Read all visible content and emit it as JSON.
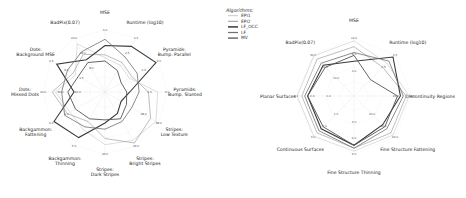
{
  "legend": {
    "title": "Algorithms:",
    "items": [
      {
        "name": "EPI1",
        "color": "#c8c8c8",
        "width": 0.6
      },
      {
        "name": "EPI2",
        "color": "#a0a0a0",
        "width": 0.7
      },
      {
        "name": "LF_OCC",
        "color": "#3a3a3a",
        "width": 1.1
      },
      {
        "name": "LF",
        "color": "#707070",
        "width": 0.8
      },
      {
        "name": "MV",
        "color": "#555555",
        "width": 0.9
      }
    ]
  },
  "chart_data": [
    {
      "type": "radar",
      "title": "",
      "axes": [
        "MSE",
        "Runtime (log10)",
        "Pyramids: Bump. Parallel",
        "Pyramids: Bump. Slanted",
        "Stripes: Low Texture",
        "Stripes: Bright Stripes",
        "Stripes: Dark Stripes",
        "Backgammon: Thinning",
        "Backgammon: Fattening",
        "Dots: Missed Dots",
        "Dots: Background MSE",
        "BadPix(0.07)"
      ],
      "tick_labels": {
        "MSE": [
          "3.0"
        ],
        "Runtime (log10)": [
          "4.5",
          "2.5"
        ],
        "Pyramids: Bump. Parallel": [
          "3.0",
          "1.0"
        ],
        "Pyramids: Bump. Slanted": [
          "3.0",
          "2.0"
        ],
        "Stripes: Low Texture": [
          "38.0",
          "28.0"
        ],
        "Stripes: Bright Stripes": [
          "46.0"
        ],
        "Stripes: Dark Stripes": [
          "46.0"
        ],
        "Backgammon: Thinning": [
          "5.0"
        ],
        "Backgammon: Fattening": [
          "6.0",
          "4.0"
        ],
        "Dots: Missed Dots": [
          "40.0",
          "30.0",
          "20.0"
        ],
        "Dots: Background MSE": [
          "4.5",
          "3.0",
          "1.5"
        ],
        "BadPix(0.07)": [
          "24.0",
          "18.0",
          "8.0"
        ]
      },
      "series": [
        {
          "name": "EPI1",
          "values": [
            0.55,
            0.5,
            0.45,
            0.85,
            0.95,
            0.9,
            0.85,
            0.7,
            0.65,
            0.8,
            0.55,
            0.9
          ]
        },
        {
          "name": "EPI2",
          "values": [
            0.6,
            0.55,
            0.5,
            0.7,
            0.85,
            0.95,
            0.75,
            0.55,
            0.7,
            0.85,
            0.6,
            0.7
          ]
        },
        {
          "name": "LF_OCC",
          "values": [
            0.75,
            0.85,
            0.95,
            0.4,
            0.3,
            0.4,
            0.5,
            0.85,
            0.95,
            0.5,
            0.9,
            0.6
          ]
        },
        {
          "name": "LF",
          "values": [
            0.85,
            0.65,
            0.6,
            0.55,
            0.5,
            0.55,
            0.6,
            0.65,
            0.75,
            0.7,
            0.7,
            0.75
          ]
        },
        {
          "name": "MV",
          "values": [
            0.5,
            0.4,
            0.3,
            0.35,
            0.4,
            0.5,
            0.45,
            0.5,
            0.55,
            0.6,
            0.5,
            0.55
          ]
        }
      ],
      "range": [
        0,
        1
      ]
    },
    {
      "type": "radar",
      "title": "",
      "axes": [
        "MSE",
        "Runtime (log10)",
        "Discontinuity Regions",
        "Fine Structure Fattening",
        "Fine Structure Thinning",
        "Continuous Surfaces",
        "Planar Surfaces",
        "BadPix(0.07)"
      ],
      "tick_labels": {
        "MSE": [
          "12.0",
          "8.0",
          "4.0"
        ],
        "Runtime (log10)": [
          "4.5",
          "2.5"
        ],
        "Discontinuity Regions": [
          "30.0",
          "20.0"
        ],
        "Fine Structure Fattening": [
          "60.0",
          "40.0",
          "20.0"
        ],
        "Fine Structure Thinning": [
          "9.0",
          "6.0",
          "3.0"
        ],
        "Continuous Surfaces": [
          "3.0",
          "2.0",
          "1.0"
        ],
        "Planar Surfaces": [
          "3.0",
          "2.0",
          "1.0"
        ],
        "BadPix(0.07)": [
          "30.0",
          "20.0",
          "10.0"
        ]
      },
      "series": [
        {
          "name": "EPI1",
          "values": [
            0.95,
            0.8,
            0.95,
            0.95,
            0.95,
            0.98,
            0.98,
            0.98
          ]
        },
        {
          "name": "EPI2",
          "values": [
            0.85,
            0.7,
            0.9,
            0.9,
            0.9,
            0.9,
            0.9,
            0.9
          ]
        },
        {
          "name": "LF_OCC",
          "values": [
            0.6,
            0.95,
            0.8,
            0.7,
            0.85,
            0.8,
            0.8,
            0.75
          ]
        },
        {
          "name": "LF",
          "values": [
            0.75,
            0.85,
            0.85,
            0.8,
            0.9,
            0.85,
            0.85,
            0.8
          ]
        },
        {
          "name": "MV",
          "values": [
            0.7,
            0.4,
            0.75,
            0.75,
            0.85,
            0.75,
            0.8,
            0.7
          ]
        }
      ],
      "range": [
        0,
        1
      ]
    }
  ]
}
